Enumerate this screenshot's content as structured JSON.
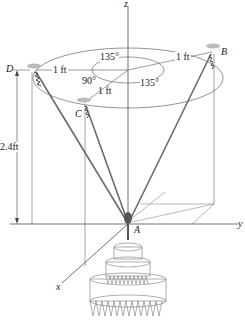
{
  "figure": {
    "top_caption_fragment": "…pp…    …p…",
    "axes": {
      "x": "x",
      "y": "y",
      "z": "z"
    },
    "points": {
      "A": "A",
      "B": "B",
      "C": "C",
      "D": "D"
    },
    "dimensions": {
      "height": "2.4ft",
      "radius_D": "1 ft",
      "radius_B": "1 ft",
      "radius_C": "1 ft"
    },
    "angles": {
      "top": "135°",
      "right": "135°",
      "left": "90°"
    },
    "colors": {
      "line": "#555555",
      "cable": "#6b6b6b",
      "axis": "#333333",
      "text": "#222222"
    }
  }
}
